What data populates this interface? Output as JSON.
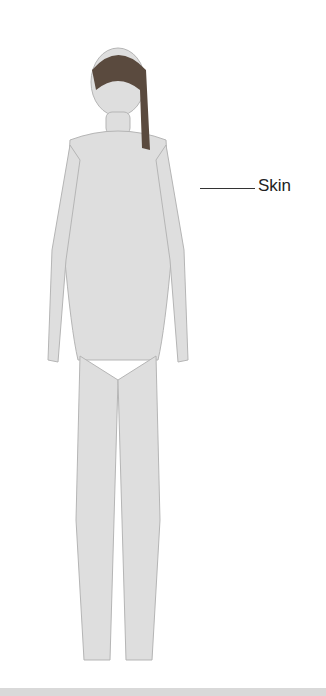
{
  "diagram": {
    "labels": [
      {
        "text": "Skin"
      }
    ],
    "colors": {
      "figure_fill": "#dedede",
      "figure_stroke": "#b5b5b5",
      "hair": "#5a4a3e",
      "label": "#222222"
    }
  }
}
